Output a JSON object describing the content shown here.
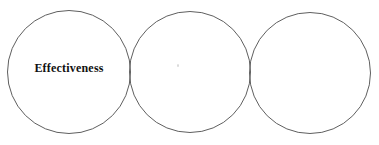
{
  "diagram": {
    "type": "three-circle-diagram",
    "circles": [
      {
        "position": "left",
        "label": "Effectiveness"
      },
      {
        "position": "middle",
        "label": ""
      },
      {
        "position": "right",
        "label": ""
      }
    ],
    "colors": {
      "background": "#ffffff",
      "circle_outline": "#5f5f5f",
      "label_text": "#111111"
    }
  }
}
